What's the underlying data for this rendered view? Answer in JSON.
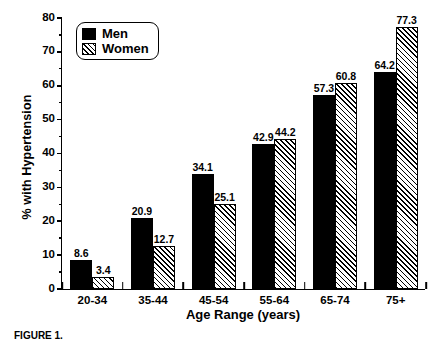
{
  "chart_data": {
    "type": "bar",
    "title": "",
    "xlabel": "Age Range (years)",
    "ylabel": "% with Hypertension",
    "categories": [
      "20-34",
      "35-44",
      "45-54",
      "55-64",
      "65-74",
      "75+"
    ],
    "series": [
      {
        "name": "Men",
        "values": [
          8.6,
          20.9,
          34.1,
          42.9,
          57.3,
          64.2
        ]
      },
      {
        "name": "Women",
        "values": [
          3.4,
          12.7,
          25.1,
          44.2,
          60.8,
          77.3
        ]
      }
    ],
    "ylim": [
      0,
      80
    ],
    "yticks": [
      0,
      10,
      20,
      30,
      40,
      50,
      60,
      70,
      80
    ],
    "ytick_labels": [
      "0",
      "10",
      "20",
      "30",
      "40",
      "50",
      "60",
      "70",
      "80"
    ],
    "yminor_interval": 5,
    "grid": false,
    "legend": {
      "position": "top-left",
      "entries": [
        {
          "label": "Men",
          "style": "solid-black"
        },
        {
          "label": "Women",
          "style": "diagonal-hatch"
        }
      ]
    },
    "data_labels": {
      "Men": [
        "8.6",
        "20.9",
        "34.1",
        "42.9",
        "57.3",
        "64.2"
      ],
      "Women": [
        "3.4",
        "12.7",
        "25.1",
        "44.2",
        "60.8",
        "77.3"
      ]
    },
    "colors": {
      "men_fill": "#000000",
      "women_fill": "#ffffff",
      "hatch": "#000000",
      "axis": "#000000",
      "background": "#ffffff"
    }
  },
  "caption": {
    "text": "FIGURE 1."
  }
}
